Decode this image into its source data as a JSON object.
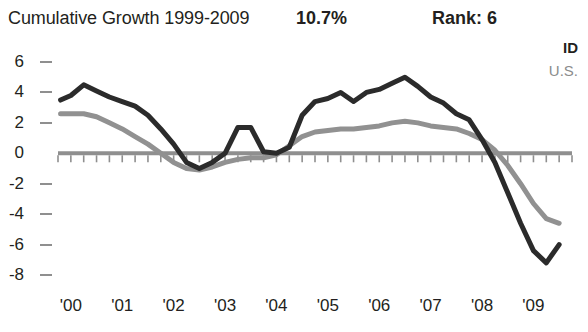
{
  "header": {
    "title": "Cumulative Growth 1999-2009",
    "growth_value": "10.7%",
    "rank_value": "Rank: 6"
  },
  "legend": {
    "entries": [
      {
        "label": "ID",
        "color": "#231f20"
      },
      {
        "label": "U.S.",
        "color": "#8c8c8c"
      }
    ]
  },
  "colors": {
    "id_line": "#2b2b2b",
    "us_line": "#919191",
    "axis": "#8f8f8f",
    "text": "#231f20"
  },
  "chart_data": {
    "type": "line",
    "title": "Cumulative Growth 1999-2009",
    "xlabel": "",
    "ylabel": "",
    "xlim": [
      1999.75,
      2009.75
    ],
    "ylim": [
      -8,
      6
    ],
    "grid": false,
    "legend_position": "top-right",
    "yticks": [
      6,
      4,
      2,
      0,
      -2,
      -4,
      -6,
      -8
    ],
    "ytick_labels": [
      "6",
      "4",
      "2",
      "0",
      "-2",
      "-4",
      "-6",
      "-8"
    ],
    "xticks": [
      2000,
      2001,
      2002,
      2003,
      2004,
      2005,
      2006,
      2007,
      2008,
      2009
    ],
    "xtick_labels": [
      "'00",
      "'01",
      "'02",
      "'03",
      "'04",
      "'05",
      "'06",
      "'07",
      "'08",
      "'09"
    ],
    "minor_xticks_per_year": 4,
    "zero_line": true,
    "series": [
      {
        "name": "ID",
        "color": "#2b2b2b",
        "x": [
          1999.8,
          2000.0,
          2000.25,
          2000.5,
          2000.75,
          2001.0,
          2001.25,
          2001.5,
          2001.75,
          2002.0,
          2002.25,
          2002.5,
          2002.75,
          2003.0,
          2003.25,
          2003.5,
          2003.75,
          2004.0,
          2004.25,
          2004.5,
          2004.75,
          2005.0,
          2005.25,
          2005.5,
          2005.75,
          2006.0,
          2006.25,
          2006.5,
          2006.75,
          2007.0,
          2007.25,
          2007.5,
          2007.75,
          2008.0,
          2008.25,
          2008.5,
          2008.75,
          2009.0,
          2009.25,
          2009.5
        ],
        "y": [
          3.5,
          3.8,
          4.5,
          4.1,
          3.7,
          3.4,
          3.1,
          2.5,
          1.6,
          0.6,
          -0.6,
          -1.0,
          -0.6,
          0.0,
          1.7,
          1.7,
          0.1,
          0.0,
          0.4,
          2.5,
          3.4,
          3.6,
          4.0,
          3.4,
          4.0,
          4.2,
          4.6,
          5.0,
          4.4,
          3.7,
          3.3,
          2.6,
          2.2,
          0.9,
          -0.6,
          -2.6,
          -4.6,
          -6.4,
          -7.2,
          -6.0
        ]
      },
      {
        "name": "U.S.",
        "color": "#919191",
        "x": [
          1999.8,
          2000.0,
          2000.25,
          2000.5,
          2000.75,
          2001.0,
          2001.25,
          2001.5,
          2001.75,
          2002.0,
          2002.25,
          2002.5,
          2002.75,
          2003.0,
          2003.25,
          2003.5,
          2003.75,
          2004.0,
          2004.25,
          2004.5,
          2004.75,
          2005.0,
          2005.25,
          2005.5,
          2005.75,
          2006.0,
          2006.25,
          2006.5,
          2006.75,
          2007.0,
          2007.25,
          2007.5,
          2007.75,
          2008.0,
          2008.25,
          2008.5,
          2008.75,
          2009.0,
          2009.25,
          2009.5
        ],
        "y": [
          2.6,
          2.6,
          2.6,
          2.4,
          2.0,
          1.6,
          1.1,
          0.6,
          0.0,
          -0.6,
          -1.0,
          -1.1,
          -0.9,
          -0.6,
          -0.4,
          -0.3,
          -0.3,
          -0.1,
          0.5,
          1.1,
          1.4,
          1.5,
          1.6,
          1.6,
          1.7,
          1.8,
          2.0,
          2.1,
          2.0,
          1.8,
          1.7,
          1.6,
          1.3,
          0.9,
          0.2,
          -0.8,
          -2.0,
          -3.3,
          -4.3,
          -4.6
        ]
      }
    ]
  }
}
